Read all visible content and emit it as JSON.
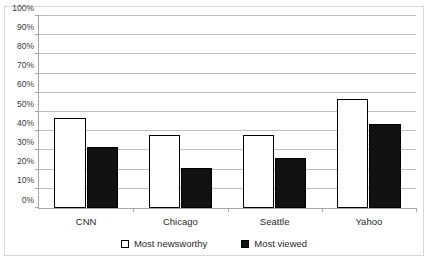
{
  "chart_data": {
    "type": "bar",
    "title": "",
    "subtitle": "",
    "xlabel": "",
    "ylabel": "",
    "categories": [
      "CNN",
      "Chicago",
      "Seattle",
      "Yahoo"
    ],
    "series": [
      {
        "name": "Most newsworthy",
        "values": [
          47,
          38,
          38,
          57
        ],
        "color": "#ffffff",
        "edge_color": "#000000",
        "swatch": "open-square"
      },
      {
        "name": "Most viewed",
        "values": [
          32,
          21,
          26,
          44
        ],
        "color": "#111111",
        "edge_color": "#000000",
        "swatch": "filled-square"
      }
    ],
    "ylim": [
      0,
      100
    ],
    "ytick_values": [
      0,
      10,
      20,
      30,
      40,
      50,
      60,
      70,
      80,
      90,
      100
    ],
    "ytick_labels": [
      "0%",
      "10%",
      "20%",
      "30%",
      "40%",
      "50%",
      "60%",
      "70%",
      "80%",
      "90%",
      "100%"
    ],
    "grid": "horizontal",
    "legend_position": "bottom-center",
    "frame": "outer-border",
    "value_format": "percent"
  }
}
